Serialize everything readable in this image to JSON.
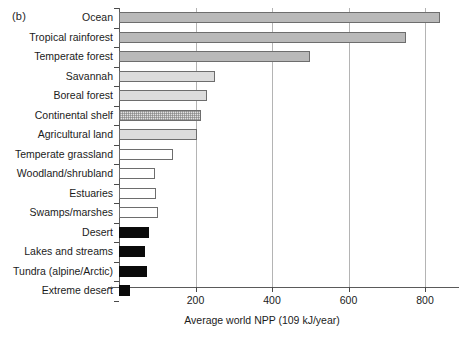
{
  "figure": {
    "panel_label": "(b)"
  },
  "chart_data": {
    "type": "bar",
    "orientation": "horizontal",
    "title": "",
    "xlabel": "Average world NPP (109 kJ/year)",
    "ylabel": "",
    "xlim": [
      0,
      900
    ],
    "xticks": [
      200,
      400,
      600,
      800
    ],
    "grid": "vertical",
    "legend": "none",
    "categories": [
      "Ocean",
      "Tropical rainforest",
      "Temperate forest",
      "Savannah",
      "Boreal forest",
      "Continental shelf",
      "Agricultural land",
      "Temperate grassland",
      "Woodland/shrubland",
      "Estuaries",
      "Swamps/marshes",
      "Desert",
      "Lakes and streams",
      "Tundra (alpine/Arctic)",
      "Extreme desert"
    ],
    "values": [
      840,
      750,
      500,
      250,
      230,
      215,
      205,
      140,
      95,
      98,
      102,
      78,
      68,
      72,
      30
    ],
    "bar_styles": [
      "fill-dark",
      "fill-dark",
      "fill-dark",
      "fill-light",
      "fill-light",
      "fill-stipple",
      "fill-light",
      "fill-white",
      "fill-white",
      "fill-white",
      "fill-white",
      "fill-black",
      "fill-black",
      "fill-black",
      "fill-black"
    ]
  },
  "colors": {
    "axis": "#5a5a5a",
    "grid": "#b4b4b4",
    "bar_outline": "#6d6d6d",
    "bar_dark": "#b9b9b9",
    "bar_light": "#dcdcdc",
    "bar_white": "#ffffff",
    "bar_black": "#0a0a0a",
    "text": "#1b1b1b",
    "background": "#ffffff"
  }
}
